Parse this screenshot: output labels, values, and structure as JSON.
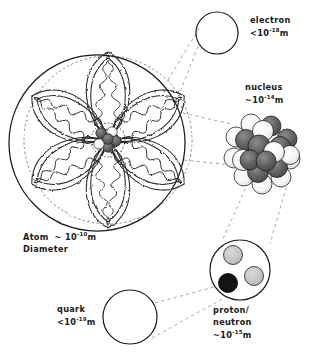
{
  "diagram": {
    "background_color": "#ffffff",
    "ink_color": "#1a1a1a"
  },
  "labels": {
    "electron": {
      "name": "electron",
      "size_prefix": "<",
      "size_base": "10",
      "size_exponent": "-18",
      "size_unit": "m",
      "line1": "electron",
      "line2": "<10",
      "line2_sup": "-18",
      "line2_tail": "m"
    },
    "nucleus": {
      "name": "nucleus",
      "size_prefix": "~",
      "size_base": "10",
      "size_exponent": "-14",
      "size_unit": "m",
      "line1": "nucleus",
      "line2": "~10",
      "line2_sup": "-14",
      "line2_tail": "m"
    },
    "atom": {
      "name": "Atom",
      "size_prefix": "~",
      "size_base": "10",
      "size_exponent": "-10",
      "size_unit": "m",
      "line1": "Atom",
      "line1_mid": "~ 10",
      "line1_sup": "-10",
      "line1_tail": "m",
      "line2": "Diameter"
    },
    "quark": {
      "name": "quark",
      "size_prefix": "<",
      "size_base": "10",
      "size_exponent": "-19",
      "size_unit": "m",
      "line1": "quark",
      "line2": "<10",
      "line2_sup": "-19",
      "line2_tail": "m"
    },
    "proton_neutron": {
      "name": "proton/neutron",
      "size_prefix": "~",
      "size_base": "10",
      "size_exponent": "-15",
      "size_unit": "m",
      "line1": "proton/",
      "line2": "neutron",
      "line3": "~10",
      "line3_sup": "-15",
      "line3_tail": "m"
    }
  },
  "colors": {
    "ink": "#1a1a1a",
    "sphere_dark": "#5e5e5e",
    "sphere_light": "#ffffff",
    "quark_light": "#c6c6c6",
    "quark_dark": "#141414",
    "dash": "#7a7a7a",
    "background": "#ffffff"
  },
  "objects": {
    "atom_circle": {
      "cx": 97,
      "cy": 143,
      "r": 88
    },
    "electron_circle": {
      "cx": 217,
      "cy": 33,
      "r": 21
    },
    "quark_circle": {
      "cx": 130,
      "cy": 317,
      "r": 27
    },
    "proton_circle": {
      "cx": 240,
      "cy": 270,
      "r": 30
    },
    "nucleus_cluster": {
      "cx": 262,
      "cy": 152,
      "r": 33
    },
    "atom_nucleus": {
      "cx": 108,
      "cy": 140,
      "r": 16
    },
    "orbital_lobes": 6
  },
  "proton_quarks": [
    {
      "cx": 232,
      "cy": 255,
      "r": 9,
      "fill": "quark_light"
    },
    {
      "cx": 254,
      "cy": 275,
      "r": 9,
      "fill": "quark_light"
    },
    {
      "cx": 228,
      "cy": 282,
      "r": 9,
      "fill": "quark_dark"
    }
  ]
}
